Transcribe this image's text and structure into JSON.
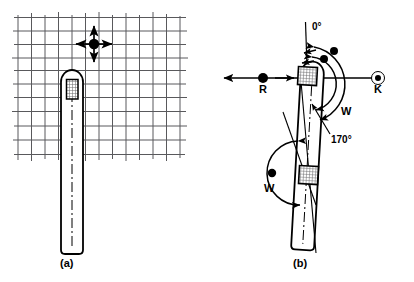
{
  "figure": {
    "background_color": "#ffffff",
    "ink_color": "#000000",
    "grid_color": "#59595c",
    "hatch_color": "#6e6e70"
  },
  "panels": [
    {
      "id": "a",
      "caption": "(a)",
      "description": "Probe on graph-paper grid with four-way translation marker",
      "grid": {
        "visible": true,
        "columns": 13,
        "rows": 11,
        "x_lines": [
          18,
          32,
          45,
          58,
          72,
          85,
          99,
          112,
          126,
          140,
          153,
          166,
          180
        ],
        "y_lines": [
          17,
          31,
          44,
          57,
          70,
          84,
          98,
          112,
          127,
          141,
          155
        ]
      },
      "marker": {
        "name": "four-way-move-marker",
        "shape": "filled-dot-with-four-arrows",
        "cx": 94,
        "cy": 44,
        "arm": 18
      },
      "probe": {
        "x": 61,
        "y": 70,
        "width": 22,
        "height": 185,
        "tip": "rounded",
        "center_line": "dash-dot",
        "transducer": {
          "name": "transducer-element",
          "fill": "cross-hatch",
          "x": 67,
          "y": 80,
          "width": 11,
          "height": 19
        }
      }
    },
    {
      "id": "b",
      "caption": "(b)",
      "description": "Tilted probe with rotation angles, reference axis and sector width",
      "probe": {
        "tilt_degrees": 4,
        "top_y": 62,
        "bottom_y": 250,
        "width": 23,
        "tip": "rounded",
        "center_line": "dash-dot",
        "transducers": [
          {
            "name": "transducer-element-top",
            "fill": "cross-hatch"
          },
          {
            "name": "transducer-element-bottom",
            "fill": "cross-hatch"
          }
        ]
      },
      "reference_axis": {
        "name": "horizontal-reference-axis",
        "y": 78,
        "x_start": 222,
        "x_end": 388,
        "left_arrow": true
      },
      "markers": [
        {
          "label": "R",
          "name": "reference-point-r",
          "style": "filled-dot",
          "x": 263,
          "y": 78,
          "label_x": 259,
          "label_y": 84
        },
        {
          "label": "K",
          "name": "reference-point-k",
          "style": "ringed-dot",
          "x": 378,
          "y": 78,
          "label_x": 374,
          "label_y": 84
        }
      ],
      "angles": [
        {
          "label": "0°",
          "name": "angle-zero-label",
          "x": 312,
          "y": 27
        },
        {
          "label": "170°",
          "name": "angle-170-label",
          "x": 331,
          "y": 140
        }
      ],
      "sector_labels": [
        {
          "label": "W",
          "name": "sector-width-label-upper",
          "x": 341,
          "y": 111
        },
        {
          "label": "W",
          "name": "sector-width-label-lower",
          "x": 266,
          "y": 187
        }
      ],
      "rotation_arcs": [
        {
          "name": "rotation-arc-outer",
          "has_dot": true
        },
        {
          "name": "rotation-arc-inner",
          "has_dot": true
        },
        {
          "name": "sector-arc-lower",
          "has_dot": true
        }
      ]
    }
  ]
}
